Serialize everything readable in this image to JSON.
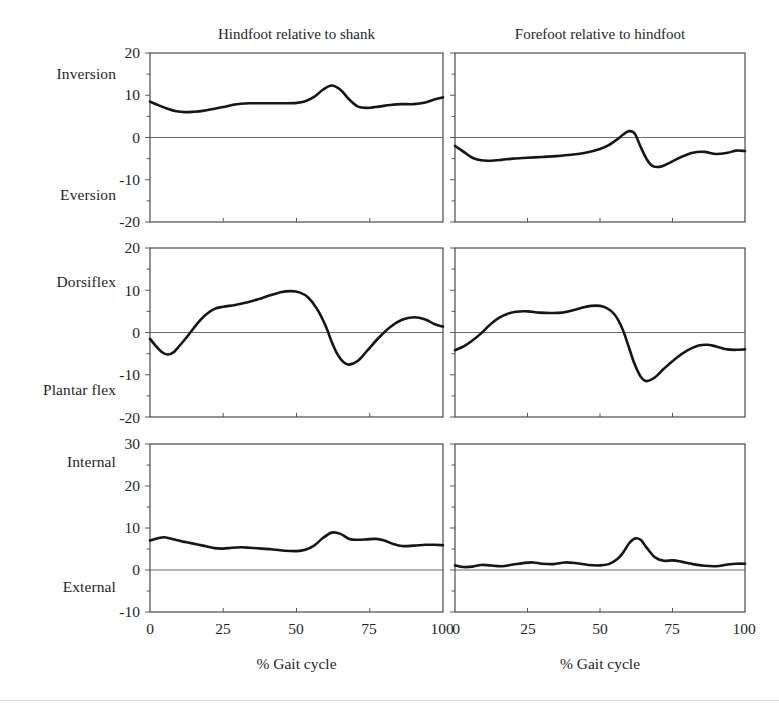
{
  "figure": {
    "column_titles": [
      "Hindfoot relative to shank",
      "Forefoot relative to hindfoot"
    ],
    "x_axis_title": "% Gait cycle",
    "row_labels": [
      {
        "positive": "Inversion",
        "negative": "Eversion"
      },
      {
        "positive": "Dorsiflex",
        "negative": "Plantar flex"
      },
      {
        "positive": "Internal",
        "negative": "External"
      }
    ],
    "y_ticks_rows": [
      [
        "20",
        "10",
        "0",
        "-10",
        "-20"
      ],
      [
        "20",
        "10",
        "0",
        "-10",
        "-20"
      ],
      [
        "30",
        "20",
        "10",
        "0",
        "-10"
      ]
    ],
    "x_ticks": [
      "0",
      "25",
      "50",
      "75",
      "100"
    ],
    "curve_color": "#151515",
    "frame_color": "#3a3a3a"
  },
  "chart_data": [
    {
      "type": "line",
      "title": "Hindfoot relative to shank — Inversion/Eversion",
      "xlabel": "% Gait cycle",
      "ylabel": "Inversion (+) / Eversion (−) [deg]",
      "xlim": [
        0,
        100
      ],
      "ylim": [
        -20,
        20
      ],
      "yticks": [
        -20,
        -10,
        0,
        10,
        20
      ],
      "xticks": [
        0,
        25,
        50,
        75,
        100
      ],
      "grid": false,
      "legend": "none",
      "zero_reference_line": true,
      "x": [
        0,
        3,
        6,
        9,
        12,
        15,
        18,
        21,
        25,
        28,
        31,
        34,
        38,
        42,
        46,
        50,
        53,
        56,
        59,
        62,
        65,
        68,
        71,
        74,
        78,
        82,
        86,
        90,
        94,
        97,
        100
      ],
      "y": [
        8.5,
        7.6,
        6.8,
        6.2,
        6.0,
        6.1,
        6.3,
        6.7,
        7.2,
        7.7,
        8.0,
        8.1,
        8.1,
        8.1,
        8.1,
        8.2,
        8.6,
        9.6,
        11.3,
        12.3,
        11.3,
        9.0,
        7.3,
        7.0,
        7.3,
        7.7,
        7.9,
        7.9,
        8.3,
        9.0,
        9.5
      ]
    },
    {
      "type": "line",
      "title": "Forefoot relative to hindfoot — Inversion/Eversion",
      "xlabel": "% Gait cycle",
      "ylabel": "Inversion (+) / Eversion (−) [deg]",
      "xlim": [
        0,
        100
      ],
      "ylim": [
        -20,
        20
      ],
      "yticks": [
        -20,
        -10,
        0,
        10,
        20
      ],
      "xticks": [
        0,
        25,
        50,
        75,
        100
      ],
      "grid": false,
      "legend": "none",
      "zero_reference_line": true,
      "x": [
        0,
        3,
        6,
        9,
        12,
        16,
        20,
        25,
        30,
        35,
        40,
        45,
        50,
        53,
        56,
        58,
        60,
        62,
        64,
        66,
        68,
        71,
        74,
        78,
        82,
        86,
        90,
        94,
        97,
        100
      ],
      "y": [
        -2.0,
        -3.4,
        -4.8,
        -5.4,
        -5.5,
        -5.3,
        -5.0,
        -4.8,
        -4.6,
        -4.4,
        -4.1,
        -3.6,
        -2.7,
        -1.8,
        -0.4,
        0.7,
        1.5,
        0.9,
        -2.2,
        -5.0,
        -6.7,
        -6.9,
        -6.0,
        -4.6,
        -3.6,
        -3.4,
        -3.9,
        -3.6,
        -3.1,
        -3.2
      ]
    },
    {
      "type": "line",
      "title": "Hindfoot relative to shank — Dorsiflexion/Plantar flexion",
      "xlabel": "% Gait cycle",
      "ylabel": "Dorsiflex (+) / Plantar flex (−) [deg]",
      "xlim": [
        0,
        100
      ],
      "ylim": [
        -20,
        20
      ],
      "yticks": [
        -20,
        -10,
        0,
        10,
        20
      ],
      "xticks": [
        0,
        25,
        50,
        75,
        100
      ],
      "grid": false,
      "legend": "none",
      "zero_reference_line": true,
      "x": [
        0,
        2,
        4,
        6,
        8,
        10,
        13,
        16,
        19,
        22,
        25,
        29,
        33,
        37,
        41,
        45,
        48,
        51,
        54,
        57,
        60,
        62,
        64,
        66,
        68,
        71,
        74,
        78,
        82,
        86,
        90,
        94,
        97,
        100
      ],
      "y": [
        -1.5,
        -3.2,
        -4.6,
        -5.2,
        -4.7,
        -3.2,
        -0.7,
        2.0,
        4.2,
        5.6,
        6.1,
        6.5,
        7.1,
        7.9,
        8.8,
        9.6,
        9.8,
        9.5,
        8.3,
        5.6,
        1.5,
        -2.2,
        -5.2,
        -7.0,
        -7.6,
        -6.7,
        -4.4,
        -1.3,
        1.3,
        3.0,
        3.6,
        3.1,
        2.0,
        1.4
      ]
    },
    {
      "type": "line",
      "title": "Forefoot relative to hindfoot — Dorsiflexion/Plantar flexion",
      "xlabel": "% Gait cycle",
      "ylabel": "Dorsiflex (+) / Plantar flex (−) [deg]",
      "xlim": [
        0,
        100
      ],
      "ylim": [
        -20,
        20
      ],
      "yticks": [
        -20,
        -10,
        0,
        10,
        20
      ],
      "xticks": [
        0,
        25,
        50,
        75,
        100
      ],
      "grid": false,
      "legend": "none",
      "zero_reference_line": true,
      "x": [
        0,
        3,
        6,
        9,
        12,
        15,
        18,
        21,
        25,
        29,
        33,
        37,
        41,
        44,
        47,
        50,
        52,
        54,
        56,
        58,
        60,
        62,
        64,
        66,
        69,
        72,
        76,
        80,
        84,
        87,
        90,
        94,
        97,
        100
      ],
      "y": [
        -4.2,
        -3.3,
        -1.9,
        -0.2,
        1.8,
        3.4,
        4.4,
        4.9,
        5.0,
        4.7,
        4.6,
        4.7,
        5.3,
        5.9,
        6.3,
        6.3,
        5.9,
        5.0,
        3.3,
        0.4,
        -3.6,
        -7.6,
        -10.4,
        -11.5,
        -10.6,
        -8.6,
        -6.2,
        -4.3,
        -3.1,
        -2.9,
        -3.3,
        -4.0,
        -4.1,
        -4.0
      ]
    },
    {
      "type": "line",
      "title": "Hindfoot relative to shank — Internal/External rotation",
      "xlabel": "% Gait cycle",
      "ylabel": "Internal (+) / External (−) [deg]",
      "xlim": [
        0,
        100
      ],
      "ylim": [
        -10,
        30
      ],
      "yticks": [
        -10,
        0,
        10,
        20,
        30
      ],
      "xticks": [
        0,
        25,
        50,
        75,
        100
      ],
      "grid": false,
      "legend": "none",
      "zero_reference_line": true,
      "x": [
        0,
        3,
        5,
        8,
        11,
        14,
        18,
        22,
        25,
        28,
        31,
        34,
        38,
        42,
        46,
        50,
        53,
        56,
        59,
        62,
        65,
        68,
        71,
        74,
        77,
        80,
        83,
        86,
        90,
        94,
        97,
        100
      ],
      "y": [
        7.0,
        7.6,
        7.8,
        7.3,
        6.8,
        6.4,
        5.8,
        5.2,
        5.1,
        5.3,
        5.4,
        5.3,
        5.1,
        4.9,
        4.6,
        4.5,
        4.8,
        5.8,
        7.6,
        8.9,
        8.6,
        7.4,
        7.2,
        7.3,
        7.4,
        7.0,
        6.2,
        5.7,
        5.8,
        6.0,
        6.0,
        5.9
      ]
    },
    {
      "type": "line",
      "title": "Forefoot relative to hindfoot — Internal/External rotation",
      "xlabel": "% Gait cycle",
      "ylabel": "Internal (+) / External (−) [deg]",
      "xlim": [
        0,
        100
      ],
      "ylim": [
        -10,
        30
      ],
      "yticks": [
        -10,
        0,
        10,
        20,
        30
      ],
      "xticks": [
        0,
        25,
        50,
        75,
        100
      ],
      "grid": false,
      "legend": "none",
      "zero_reference_line": true,
      "x": [
        0,
        3,
        6,
        9,
        12,
        16,
        20,
        24,
        27,
        30,
        34,
        38,
        42,
        46,
        50,
        53,
        56,
        58,
        60,
        62,
        64,
        66,
        69,
        72,
        75,
        78,
        82,
        86,
        90,
        94,
        97,
        100
      ],
      "y": [
        1.1,
        0.7,
        0.8,
        1.2,
        1.1,
        0.9,
        1.3,
        1.7,
        1.8,
        1.5,
        1.4,
        1.8,
        1.6,
        1.2,
        1.1,
        1.4,
        2.6,
        4.2,
        6.3,
        7.5,
        7.2,
        5.4,
        3.0,
        2.2,
        2.3,
        2.0,
        1.4,
        1.0,
        0.9,
        1.3,
        1.5,
        1.5
      ]
    }
  ]
}
